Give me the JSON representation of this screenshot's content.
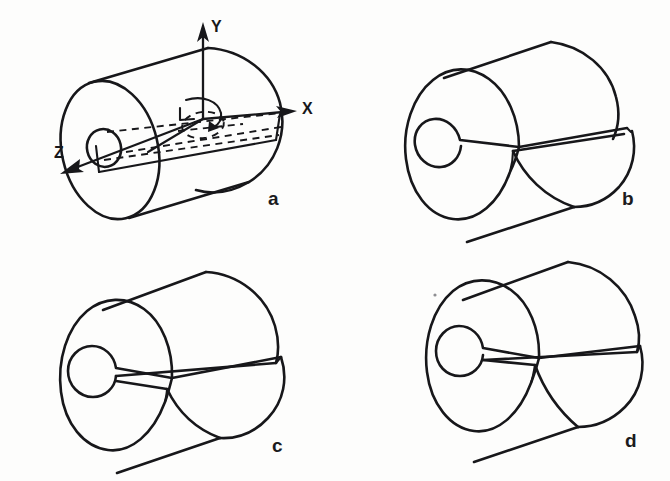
{
  "figure": {
    "title": "Hollow cylinder with longitudinal slit — four views",
    "background_color": "#fdfdfc",
    "ink_color": "#17171a",
    "panels": [
      {
        "id": "a",
        "label": "a",
        "label_x": 268,
        "label_y": 205,
        "description": "Hollow cylinder shown with Cartesian coordinate axes X, Y, Z and hidden construction lines",
        "has_axes": true,
        "has_slit": false,
        "slit_width": 0
      },
      {
        "id": "b",
        "label": "b",
        "label_x": 622,
        "label_y": 205,
        "description": "Hollow cylinder with a narrow radial slit from bore to outer surface",
        "has_axes": false,
        "has_slit": true,
        "slit_width": 0.5
      },
      {
        "id": "c",
        "label": "c",
        "label_x": 272,
        "label_y": 452,
        "description": "Hollow cylinder with a wide wedge-shaped radial slit",
        "has_axes": false,
        "has_slit": true,
        "slit_width": 2.0
      },
      {
        "id": "d",
        "label": "d",
        "label_x": 625,
        "label_y": 447,
        "description": "Hollow cylinder with a thin parallel-sided radial slit",
        "has_axes": false,
        "has_slit": true,
        "slit_width": 0.8
      }
    ],
    "axes": {
      "y": {
        "label": "Y",
        "label_x": 211,
        "label_y": 32,
        "direction": "up"
      },
      "x": {
        "label": "X",
        "label_x": 302,
        "label_y": 114,
        "direction": "right"
      },
      "z": {
        "label": "Z",
        "label_x": 54,
        "label_y": 158,
        "direction": "down-left"
      }
    }
  }
}
